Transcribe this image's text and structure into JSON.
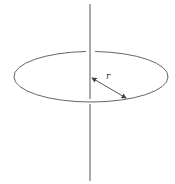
{
  "diagram": {
    "radius_label": "r",
    "colors": {
      "line": "#555555",
      "background": "#ffffff"
    }
  }
}
